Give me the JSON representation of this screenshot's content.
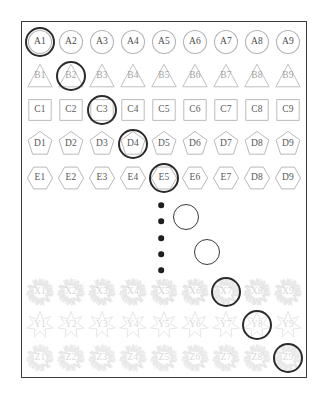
{
  "canvas": {
    "width": 326,
    "height": 400,
    "background": "#ffffff"
  },
  "frame": {
    "name": "diagram-frame",
    "x": 21,
    "y": 21,
    "width": 286,
    "height": 357,
    "border_color": "#3c3c3c",
    "border_width": 1.6
  },
  "style": {
    "shape_stroke": "#b4b4b4",
    "shape_stroke_faded": "#c9c9c9",
    "label_color": "#4a4a4a",
    "highlight_color": "#2b2b2b",
    "dot_color": "#1f1f1f",
    "circle_color": "#3a3a3a"
  },
  "columns_x": [
    40,
    71,
    102,
    133,
    164,
    195,
    226,
    257,
    288
  ],
  "rows": [
    {
      "id": "A",
      "shape": "circle",
      "y": 42,
      "opacity": 1.0,
      "labels": [
        "A1",
        "A2",
        "A3",
        "A4",
        "A5",
        "A6",
        "A7",
        "A8",
        "A9"
      ]
    },
    {
      "id": "B",
      "shape": "triangle",
      "y": 76,
      "opacity": 0.82,
      "labels": [
        "B1",
        "B2",
        "B3",
        "B4",
        "B5",
        "B6",
        "B7",
        "B8",
        "B9"
      ]
    },
    {
      "id": "C",
      "shape": "square",
      "y": 110,
      "opacity": 0.9,
      "labels": [
        "C1",
        "C2",
        "C3",
        "C4",
        "C5",
        "C6",
        "C7",
        "C8",
        "C9"
      ]
    },
    {
      "id": "D",
      "shape": "pentagon",
      "y": 144,
      "opacity": 0.92,
      "labels": [
        "D1",
        "D2",
        "D3",
        "D4",
        "D5",
        "D6",
        "D7",
        "D8",
        "D9"
      ]
    },
    {
      "id": "E",
      "shape": "hexagon",
      "y": 178,
      "opacity": 0.92,
      "labels": [
        "E1",
        "E2",
        "E3",
        "E4",
        "E5",
        "E6",
        "E7",
        "D8",
        "D9"
      ]
    },
    {
      "id": "X",
      "shape": "burst",
      "y": 292,
      "opacity": 0.5,
      "labels": [
        "X1",
        "X2",
        "X3",
        "X4",
        "X5",
        "X6",
        "X7",
        "X8",
        "X9"
      ]
    },
    {
      "id": "Y",
      "shape": "star7",
      "y": 325,
      "opacity": 0.45,
      "labels": [
        "Y1",
        "Y2",
        "Y3",
        "Y4",
        "Y5",
        "Y6",
        "Y7",
        "Y8",
        "Y9"
      ]
    },
    {
      "id": "Z",
      "shape": "burst",
      "y": 358,
      "opacity": 0.45,
      "labels": [
        "Z1",
        "Z2",
        "Z3",
        "Z4",
        "Z5",
        "Z6",
        "Z7",
        "Z8",
        "Z9"
      ]
    }
  ],
  "highlights": [
    {
      "name": "highlight-a1",
      "target": "A1",
      "cx": 40,
      "cy": 42,
      "r": 15
    },
    {
      "name": "highlight-b2",
      "target": "B2",
      "cx": 71,
      "cy": 76,
      "r": 15
    },
    {
      "name": "highlight-c3",
      "target": "C3",
      "cx": 102,
      "cy": 110,
      "r": 15
    },
    {
      "name": "highlight-d4",
      "target": "D4",
      "cx": 133,
      "cy": 144,
      "r": 15
    },
    {
      "name": "highlight-e5",
      "target": "E5",
      "cx": 164,
      "cy": 178,
      "r": 15
    },
    {
      "name": "highlight-x7",
      "target": "X7",
      "cx": 226,
      "cy": 292,
      "r": 15
    },
    {
      "name": "highlight-y8",
      "target": "Y8",
      "cx": 257,
      "cy": 325,
      "r": 15
    },
    {
      "name": "highlight-z9",
      "target": "Z9",
      "cx": 288,
      "cy": 358,
      "r": 15
    }
  ],
  "ellipsis_dots": [
    {
      "cx": 161,
      "cy": 205,
      "r": 2.8
    },
    {
      "cx": 161,
      "cy": 221,
      "r": 2.8
    },
    {
      "cx": 161,
      "cy": 238,
      "r": 2.8
    },
    {
      "cx": 161,
      "cy": 254,
      "r": 2.8
    },
    {
      "cx": 161,
      "cy": 270,
      "r": 2.8
    }
  ],
  "continuation_circles": [
    {
      "name": "continuation-circle-1",
      "cx": 186,
      "cy": 217,
      "r": 13
    },
    {
      "name": "continuation-circle-2",
      "cx": 207,
      "cy": 252,
      "r": 13
    }
  ]
}
